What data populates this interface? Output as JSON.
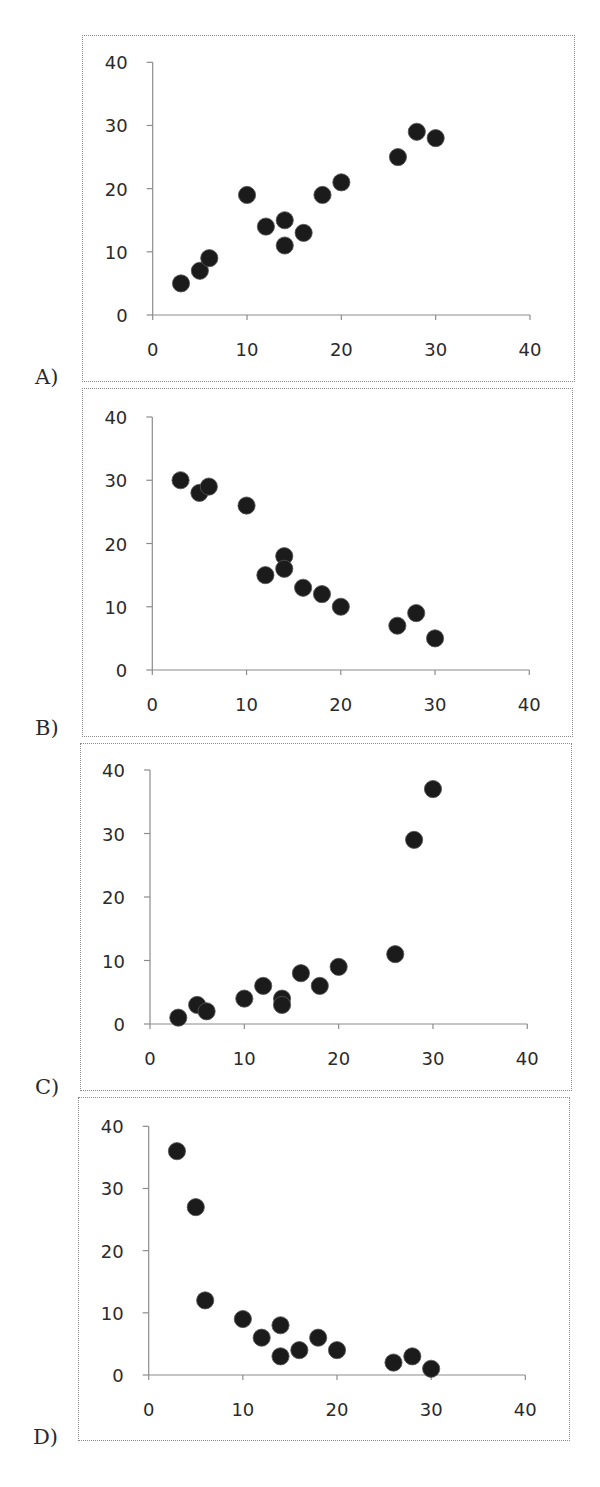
{
  "panels": [
    {
      "id": "A",
      "label": "A)"
    },
    {
      "id": "B",
      "label": "B)"
    },
    {
      "id": "C",
      "label": "C)"
    },
    {
      "id": "D",
      "label": "D)"
    }
  ],
  "chart_data": [
    {
      "type": "scatter",
      "title": "A)",
      "xlabel": "",
      "ylabel": "",
      "xlim": [
        0,
        40
      ],
      "ylim": [
        0,
        40
      ],
      "x_ticks": [
        0,
        10,
        20,
        30,
        40
      ],
      "y_ticks": [
        0,
        10,
        20,
        30,
        40
      ],
      "grid": false,
      "legend": null,
      "x": [
        3,
        5,
        6,
        10,
        12,
        14,
        14,
        16,
        18,
        20,
        26,
        28,
        30
      ],
      "y": [
        5,
        7,
        9,
        19,
        14,
        15,
        11,
        13,
        19,
        21,
        25,
        29,
        28
      ]
    },
    {
      "type": "scatter",
      "title": "B)",
      "xlabel": "",
      "ylabel": "",
      "xlim": [
        0,
        40
      ],
      "ylim": [
        0,
        40
      ],
      "x_ticks": [
        0,
        10,
        20,
        30,
        40
      ],
      "y_ticks": [
        0,
        10,
        20,
        30,
        40
      ],
      "grid": false,
      "legend": null,
      "x": [
        3,
        5,
        6,
        10,
        12,
        14,
        14,
        16,
        18,
        20,
        26,
        28,
        30
      ],
      "y": [
        30,
        28,
        29,
        26,
        15,
        18,
        16,
        13,
        12,
        10,
        7,
        9,
        5
      ]
    },
    {
      "type": "scatter",
      "title": "C)",
      "xlabel": "",
      "ylabel": "",
      "xlim": [
        0,
        40
      ],
      "ylim": [
        0,
        40
      ],
      "x_ticks": [
        0,
        10,
        20,
        30,
        40
      ],
      "y_ticks": [
        0,
        10,
        20,
        30,
        40
      ],
      "grid": false,
      "legend": null,
      "x": [
        3,
        5,
        6,
        10,
        12,
        14,
        14,
        16,
        18,
        20,
        26,
        28,
        30
      ],
      "y": [
        1,
        3,
        2,
        4,
        6,
        4,
        3,
        8,
        6,
        9,
        11,
        29,
        37
      ]
    },
    {
      "type": "scatter",
      "title": "D)",
      "xlabel": "",
      "ylabel": "",
      "xlim": [
        0,
        40
      ],
      "ylim": [
        0,
        40
      ],
      "x_ticks": [
        0,
        10,
        20,
        30,
        40
      ],
      "y_ticks": [
        0,
        10,
        20,
        30,
        40
      ],
      "grid": false,
      "legend": null,
      "x": [
        3,
        5,
        6,
        10,
        12,
        14,
        14,
        16,
        18,
        20,
        26,
        28,
        30
      ],
      "y": [
        36,
        27,
        12,
        9,
        6,
        8,
        3,
        4,
        6,
        4,
        2,
        3,
        1
      ]
    }
  ],
  "layout": [
    {
      "frame": [
        82,
        35,
        575,
        382
      ],
      "x0": 152.7,
      "x40": 530,
      "y0": 315,
      "y40": 62.3,
      "label_xy": [
        35,
        365
      ]
    },
    {
      "frame": [
        82,
        388,
        573,
        737
      ],
      "x0": 152.3,
      "x40": 529.3,
      "y0": 670,
      "y40": 417,
      "label_xy": [
        35,
        716
      ]
    },
    {
      "frame": [
        80,
        743,
        572,
        1091
      ],
      "x0": 150,
      "x40": 527.3,
      "y0": 1024,
      "y40": 770,
      "label_xy": [
        35,
        1075
      ]
    },
    {
      "frame": [
        78,
        1097,
        570,
        1441
      ],
      "x0": 148.7,
      "x40": 525.3,
      "y0": 1375,
      "y40": 1126.3,
      "label_xy": [
        33,
        1425
      ]
    }
  ],
  "colors": {
    "marker": "#1b1b1b",
    "axis": "#8c8c8c",
    "frame": "#8a8a8a",
    "text": "#2b2b2b"
  }
}
